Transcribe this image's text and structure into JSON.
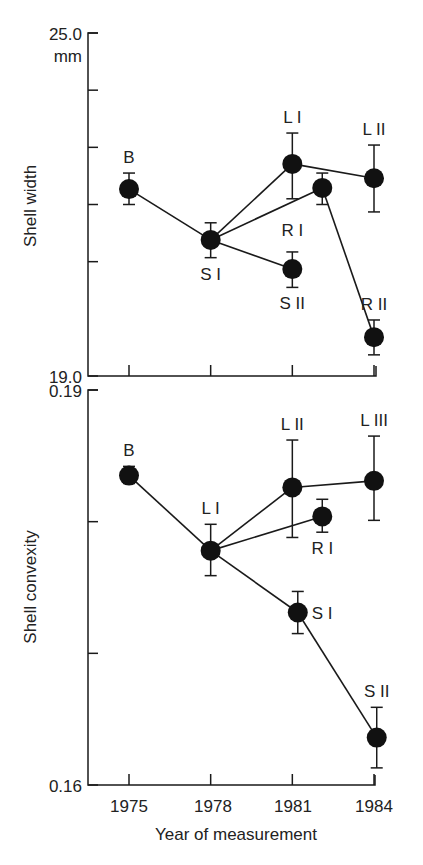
{
  "chart_data": [
    {
      "type": "line",
      "title": "",
      "ylabel": "Shell width",
      "yunit": "mm",
      "xlabel": "",
      "ylim": [
        19.0,
        25.0
      ],
      "ytick_labels": [
        "25.0",
        "19.0"
      ],
      "ytick_unit_label": "mm",
      "yticks": [
        25,
        24,
        23,
        22,
        21,
        19
      ],
      "x_ticks": [
        1975,
        1978,
        1981,
        1984
      ],
      "grid": false,
      "points": [
        {
          "id": "B",
          "label": "B",
          "x": 1975.0,
          "y": 22.27,
          "err_low": 22.0,
          "err_high": 22.55,
          "label_pos": "above"
        },
        {
          "id": "SI",
          "label": "S I",
          "x": 1978.0,
          "y": 21.38,
          "err_low": 21.07,
          "err_high": 21.68,
          "label_pos": "below"
        },
        {
          "id": "LI",
          "label": "L I",
          "x": 1981.0,
          "y": 22.71,
          "err_low": 22.1,
          "err_high": 23.25,
          "label_pos": "above"
        },
        {
          "id": "RI",
          "label": "R I",
          "x": 1982.1,
          "y": 22.29,
          "err_low": 22.0,
          "err_high": 22.55,
          "label_pos": "none"
        },
        {
          "id": "LII",
          "label": "L II",
          "x": 1984.0,
          "y": 22.46,
          "err_low": 21.87,
          "err_high": 23.04,
          "label_pos": "above"
        },
        {
          "id": "SII",
          "label": "S II",
          "x": 1981.0,
          "y": 20.87,
          "err_low": 20.55,
          "err_high": 21.17,
          "label_pos": "below"
        },
        {
          "id": "RII",
          "label": "R II",
          "x": 1984.0,
          "y": 19.68,
          "err_low": 19.37,
          "err_high": 19.98,
          "label_pos": "above"
        }
      ],
      "annotations": [
        {
          "text": "R I",
          "x": 1981.0,
          "y": 21.45
        }
      ],
      "segments": [
        [
          "B",
          "SI"
        ],
        [
          "SI",
          "LI"
        ],
        [
          "SI",
          "RI"
        ],
        [
          "SI",
          "SII"
        ],
        [
          "LI",
          "LII"
        ],
        [
          "RI",
          "RII"
        ]
      ]
    },
    {
      "type": "line",
      "title": "",
      "ylabel": "Shell convexity",
      "xlabel": "Year of measurement",
      "ylim": [
        0.16,
        0.19
      ],
      "ytick_labels": [
        "0.19",
        "0.16"
      ],
      "yticks": [
        0.19,
        0.18,
        0.17,
        0.16
      ],
      "x_ticks": [
        1975,
        1978,
        1981,
        1984
      ],
      "x_tick_labels": [
        "1975",
        "1978",
        "1981",
        "1984"
      ],
      "grid": false,
      "points": [
        {
          "id": "B",
          "label": "B",
          "x": 1975.0,
          "y": 0.1835,
          "err_low": 0.1829,
          "err_high": 0.1842,
          "label_pos": "above"
        },
        {
          "id": "LI",
          "label": "L I",
          "x": 1978.0,
          "y": 0.1778,
          "err_low": 0.1759,
          "err_high": 0.1798,
          "label_pos": "above"
        },
        {
          "id": "LII",
          "label": "L II",
          "x": 1981.0,
          "y": 0.1826,
          "err_low": 0.1788,
          "err_high": 0.1862,
          "label_pos": "above"
        },
        {
          "id": "RI",
          "label": "R I",
          "x": 1982.1,
          "y": 0.1804,
          "err_low": 0.1792,
          "err_high": 0.1817,
          "label_pos": "below"
        },
        {
          "id": "LIII",
          "label": "L III",
          "x": 1984.0,
          "y": 0.1831,
          "err_low": 0.1801,
          "err_high": 0.1865,
          "label_pos": "above"
        },
        {
          "id": "SI",
          "label": "S I",
          "x": 1981.2,
          "y": 0.1731,
          "err_low": 0.1715,
          "err_high": 0.1747,
          "label_pos": "right"
        },
        {
          "id": "SII",
          "label": "S II",
          "x": 1984.1,
          "y": 0.1636,
          "err_low": 0.1613,
          "err_high": 0.1659,
          "label_pos": "above"
        }
      ],
      "segments": [
        [
          "B",
          "LI"
        ],
        [
          "LI",
          "LII"
        ],
        [
          "LI",
          "RI"
        ],
        [
          "LI",
          "SI"
        ],
        [
          "LII",
          "LIII"
        ],
        [
          "SI",
          "SII"
        ]
      ]
    }
  ],
  "labels": {
    "top_ylabel": "Shell width",
    "top_ymax": "25.0",
    "top_yunit": "mm",
    "top_ymin": "19.0",
    "bottom_ylabel": "Shell convexity",
    "bottom_ymax": "0.19",
    "bottom_ymin": "0.16",
    "xlabel": "Year of measurement",
    "xticks": [
      "1975",
      "1978",
      "1981",
      "1984"
    ]
  }
}
